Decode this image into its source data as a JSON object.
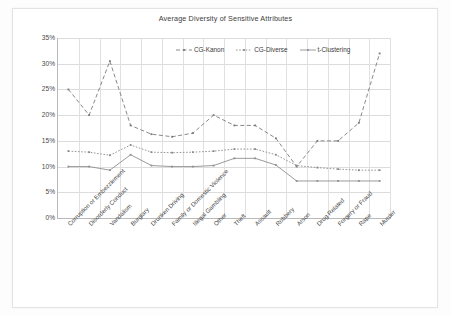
{
  "chart_data": {
    "type": "line",
    "title": "Average Diversity of Sensitive Attributes",
    "xlabel": "",
    "ylabel": "Percentage of Equivalence Class",
    "ylim": [
      0,
      35
    ],
    "ytick_labels": [
      "35%",
      "30%",
      "25%",
      "20%",
      "15%",
      "10%",
      "5%",
      "0%"
    ],
    "ytick_values": [
      35,
      30,
      25,
      20,
      15,
      10,
      5,
      0
    ],
    "grid": true,
    "legend_position": "top-center-inside",
    "categories": [
      "Corruption or Embezzlement",
      "Disorderly Conduct",
      "Vandalism",
      "Burglary",
      "Drunken Driving",
      "Family or Domestic Violence",
      "Illegal Gambling",
      "Other",
      "Theft",
      "Assault",
      "Robbery",
      "Arson",
      "Drug Related",
      "Forgery or Fraud",
      "Rape",
      "Murder"
    ],
    "series": [
      {
        "name": "CG-Kanon",
        "style": "dashed",
        "color": "#7a7a7a",
        "values": [
          25.0,
          20.0,
          30.5,
          18.0,
          16.3,
          15.8,
          16.5,
          20.0,
          18.0,
          18.0,
          15.5,
          10.0,
          15.0,
          15.0,
          18.5,
          32.0
        ]
      },
      {
        "name": "CG-Diverse",
        "style": "dotted",
        "color": "#8a8a8a",
        "values": [
          13.0,
          12.8,
          12.2,
          14.2,
          12.8,
          12.7,
          12.8,
          13.0,
          13.4,
          13.4,
          12.3,
          10.2,
          9.8,
          9.5,
          9.3,
          9.3
        ]
      },
      {
        "name": "t-Clustering",
        "style": "solid",
        "color": "#8f8f8f",
        "values": [
          10.0,
          10.0,
          9.3,
          12.3,
          10.2,
          10.0,
          10.0,
          10.2,
          11.6,
          11.6,
          10.3,
          7.2,
          7.2,
          7.2,
          7.2,
          7.2
        ]
      }
    ]
  }
}
